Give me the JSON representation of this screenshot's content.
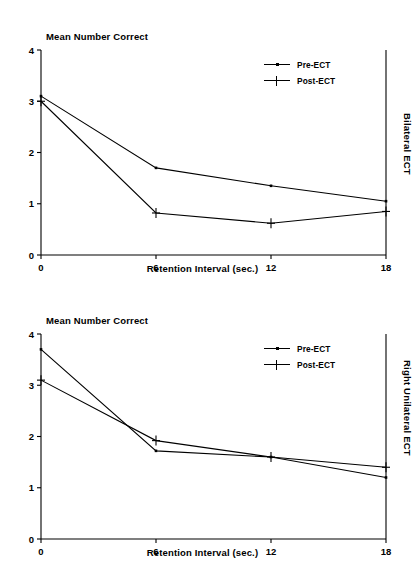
{
  "figure": {
    "panels": [
      {
        "id": "bilateral",
        "side_label": "Bilateral ECT",
        "title": "Mean Number Correct",
        "xlabel": "Retention Interval (sec.)",
        "yticks": [
          "0",
          "1",
          "2",
          "3",
          "4"
        ],
        "xticks": [
          "0",
          "6",
          "12",
          "18"
        ],
        "legend": [
          {
            "label": "Pre-ECT",
            "marker": "line-dot-marker"
          },
          {
            "label": "Post-ECT",
            "marker": "plus-marker"
          }
        ]
      },
      {
        "id": "right-unilateral",
        "side_label": "Right Unilateral ECT",
        "title": "Mean Number Correct",
        "xlabel": "Retention Interval (sec.)",
        "yticks": [
          "0",
          "1",
          "2",
          "3",
          "4"
        ],
        "xticks": [
          "0",
          "6",
          "12",
          "18"
        ],
        "legend": [
          {
            "label": "Pre-ECT",
            "marker": "line-dot-marker"
          },
          {
            "label": "Post-ECT",
            "marker": "plus-marker"
          }
        ]
      }
    ]
  },
  "chart_data": [
    {
      "type": "line",
      "title": "Mean Number Correct",
      "panel_label": "Bilateral ECT",
      "xlabel": "Retention Interval (sec.)",
      "ylabel": "Mean Number Correct",
      "x": [
        0,
        6,
        12,
        18
      ],
      "xticklabels": [
        "0",
        "6",
        "12",
        "18"
      ],
      "yticklabels": [
        "0",
        "1",
        "2",
        "3",
        "4"
      ],
      "xlim": [
        0,
        18
      ],
      "ylim": [
        0,
        4
      ],
      "grid": false,
      "legend_position": "top-right",
      "series": [
        {
          "name": "Pre-ECT",
          "marker": "line-dot-marker",
          "values": [
            3.1,
            1.7,
            1.35,
            1.05
          ]
        },
        {
          "name": "Post-ECT",
          "marker": "plus-marker",
          "values": [
            3.0,
            0.82,
            0.62,
            0.85
          ]
        }
      ]
    },
    {
      "type": "line",
      "title": "Mean Number Correct",
      "panel_label": "Right Unilateral ECT",
      "xlabel": "Retention Interval (sec.)",
      "ylabel": "Mean Number Correct",
      "x": [
        0,
        6,
        12,
        18
      ],
      "xticklabels": [
        "0",
        "6",
        "12",
        "18"
      ],
      "yticklabels": [
        "0",
        "1",
        "2",
        "3",
        "4"
      ],
      "xlim": [
        0,
        18
      ],
      "ylim": [
        0,
        4
      ],
      "grid": false,
      "legend_position": "top-right",
      "series": [
        {
          "name": "Pre-ECT",
          "marker": "line-dot-marker",
          "values": [
            3.7,
            1.72,
            1.6,
            1.2
          ]
        },
        {
          "name": "Post-ECT",
          "marker": "plus-marker",
          "values": [
            3.1,
            1.92,
            1.6,
            1.4
          ]
        }
      ]
    }
  ]
}
